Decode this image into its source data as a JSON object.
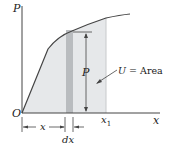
{
  "figure": {
    "axis_labels": {
      "y": "P",
      "x": "x",
      "origin": "O"
    },
    "labels": {
      "x1": "x",
      "x1_sub": "1",
      "P_height": "P",
      "area_U": "U",
      "area_eq": " = Area",
      "dim_x": "x",
      "dim_dx": "dx"
    },
    "colors": {
      "background": "#ffffff",
      "area_fill": "#e6e8ea",
      "strip_fill": "#b9bcbf",
      "line": "#444444"
    }
  }
}
